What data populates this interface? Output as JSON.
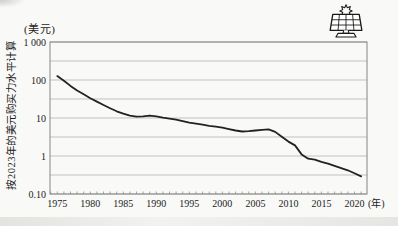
{
  "chart_data": {
    "type": "line",
    "y_unit_label": "(美元)",
    "x_unit_label": "(年)",
    "y_axis_note": "按2023年的美元购买力水平计算",
    "x_scale": "linear",
    "y_scale": "log10",
    "xlim": [
      1973.9,
      2021.9
    ],
    "ylim": [
      0.1,
      1000
    ],
    "grid": true,
    "minor_gridlines": "half-decade",
    "legend": "none",
    "line_color": "#222222",
    "grid_color": "#b4b4b4",
    "axis_color": "#858585",
    "x_ticks": [
      1975,
      1980,
      1985,
      1990,
      1995,
      2000,
      2005,
      2010,
      2015,
      2020
    ],
    "y_ticks": [
      {
        "value": 1000,
        "label": "1 000"
      },
      {
        "value": 100,
        "label": "100"
      },
      {
        "value": 10,
        "label": "10"
      },
      {
        "value": 1,
        "label": "1"
      },
      {
        "value": 0.1,
        "label": "0.10"
      }
    ],
    "series": [
      {
        "name": "price-usd",
        "x": [
          1975,
          1976,
          1977,
          1978,
          1979,
          1980,
          1981,
          1982,
          1983,
          1984,
          1985,
          1986,
          1987,
          1988,
          1989,
          1990,
          1991,
          1992,
          1993,
          1994,
          1995,
          1996,
          1997,
          1998,
          1999,
          2000,
          2001,
          2002,
          2003,
          2004,
          2005,
          2006,
          2007,
          2008,
          2009,
          2010,
          2011,
          2012,
          2013,
          2014,
          2015,
          2016,
          2017,
          2018,
          2019,
          2020,
          2021
        ],
        "values": [
          127,
          96,
          70,
          53,
          42,
          33,
          27,
          22,
          18,
          15,
          13,
          11.5,
          10.8,
          11,
          11.5,
          11,
          10.2,
          9.6,
          9,
          8.3,
          7.5,
          7.1,
          6.7,
          6.2,
          5.9,
          5.6,
          5.1,
          4.7,
          4.4,
          4.5,
          4.7,
          4.9,
          5,
          4.3,
          3.2,
          2.4,
          1.9,
          1.1,
          0.85,
          0.8,
          0.7,
          0.63,
          0.55,
          0.48,
          0.42,
          0.35,
          0.29
        ]
      }
    ],
    "icon": "solar-panel-sun-icon"
  }
}
